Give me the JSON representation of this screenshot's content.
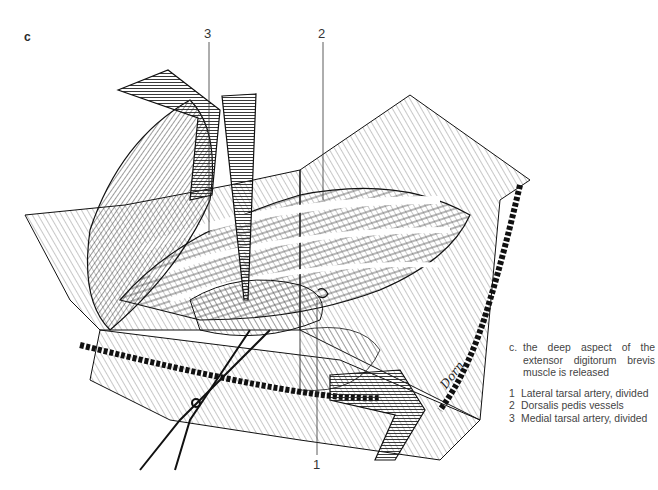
{
  "figure": {
    "panel_letter": "c",
    "callouts": [
      {
        "number": "3",
        "label": "Medial tarsal artery, divided"
      },
      {
        "number": "2",
        "label": "Dorsalis pedis vessels"
      },
      {
        "number": "1",
        "label": "Lateral tarsal artery, divided"
      }
    ],
    "signature": "Dorn"
  },
  "caption": {
    "key": "c.",
    "text": "the deep aspect of the extensor digitorum brevis muscle is released",
    "legend": [
      {
        "key": "1",
        "text": "Lateral tarsal artery, divided"
      },
      {
        "key": "2",
        "text": "Dorsalis pedis vessels"
      },
      {
        "key": "3",
        "text": "Medial tarsal artery, divided"
      }
    ]
  },
  "colors": {
    "ink": "#1a1a1a",
    "paper": "#ffffff",
    "text": "#444444"
  }
}
